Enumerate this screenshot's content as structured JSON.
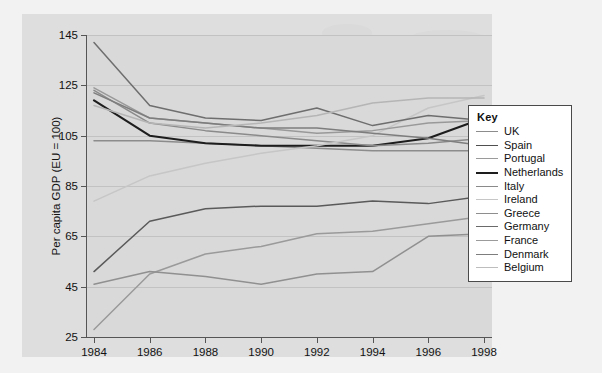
{
  "chart_data": {
    "type": "line",
    "title": "",
    "xlabel": "",
    "ylabel": "Per capita GDP (EU = 100)",
    "x": [
      1984,
      1986,
      1988,
      1990,
      1992,
      1994,
      1996,
      1998
    ],
    "xtick_labels": [
      "1984",
      "1986",
      "1988",
      "1990",
      "1992",
      "1994",
      "1996",
      "1998"
    ],
    "ytick_labels": [
      "145",
      "125",
      "105",
      "85",
      "65",
      "45",
      "25"
    ],
    "ytick_values": [
      145,
      125,
      105,
      85,
      65,
      45,
      25
    ],
    "xlim": [
      1984,
      1998
    ],
    "ylim": [
      25,
      145
    ],
    "grid": true,
    "legend_position": "right",
    "series": [
      {
        "name": "UK",
        "color": "#8c8c8c",
        "values": [
          103,
          103,
          102,
          101,
          100,
          99,
          99,
          99
        ]
      },
      {
        "name": "Spain",
        "color": "#5a5a5a",
        "values": [
          51,
          71,
          76,
          77,
          77,
          79,
          78,
          81
        ]
      },
      {
        "name": "Portugal",
        "color": "#9a9a9a",
        "values": [
          28,
          50,
          58,
          61,
          66,
          67,
          70,
          73
        ]
      },
      {
        "name": "Netherlands",
        "color": "#1d1d1d",
        "values": [
          119,
          105,
          102,
          101,
          101,
          101,
          104,
          112
        ]
      },
      {
        "name": "Italy",
        "color": "#8a8a8a",
        "values": [
          123,
          110,
          107,
          105,
          103,
          101,
          102,
          104
        ]
      },
      {
        "name": "Ireland",
        "color": "#c6c6c6",
        "values": [
          79,
          89,
          94,
          98,
          101,
          105,
          116,
          121
        ]
      },
      {
        "name": "Greece",
        "color": "#909090",
        "values": [
          46,
          51,
          49,
          46,
          50,
          51,
          65,
          66
        ]
      },
      {
        "name": "Germany",
        "color": "#6e6e6e",
        "values": [
          142,
          117,
          112,
          111,
          116,
          109,
          113,
          111
        ]
      },
      {
        "name": "France",
        "color": "#999999",
        "values": [
          124,
          112,
          110,
          108,
          106,
          107,
          110,
          111
        ]
      },
      {
        "name": "Denmark",
        "color": "#7d7d7d",
        "values": [
          122,
          112,
          110,
          108,
          108,
          106,
          104,
          101
        ]
      },
      {
        "name": "Belgium",
        "color": "#b5b5b5",
        "values": [
          117,
          110,
          108,
          110,
          113,
          118,
          120,
          120
        ]
      }
    ]
  },
  "legend": {
    "title": "Key",
    "items": [
      {
        "label": "UK",
        "color": "#8c8c8c"
      },
      {
        "label": "Spain",
        "color": "#4f4f4f"
      },
      {
        "label": "Portugal",
        "color": "#9a9a9a"
      },
      {
        "label": "Netherlands",
        "color": "#1d1d1d"
      },
      {
        "label": "Italy",
        "color": "#8a8a8a"
      },
      {
        "label": "Ireland",
        "color": "#c6c6c6"
      },
      {
        "label": "Greece",
        "color": "#8e8e8e"
      },
      {
        "label": "Germany",
        "color": "#6a6a6a"
      },
      {
        "label": "France",
        "color": "#9b9b9b"
      },
      {
        "label": "Denmark",
        "color": "#7d7d7d"
      },
      {
        "label": "Belgium",
        "color": "#bdbdbd"
      }
    ]
  }
}
